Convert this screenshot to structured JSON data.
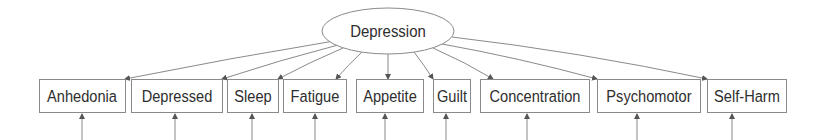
{
  "diagram": {
    "type": "factor-model",
    "latent": {
      "id": "depression",
      "label": "Depression"
    },
    "indicators": [
      {
        "id": "anhedonia",
        "label": "Anhedonia"
      },
      {
        "id": "depressed",
        "label": "Depressed"
      },
      {
        "id": "sleep",
        "label": "Sleep"
      },
      {
        "id": "fatigue",
        "label": "Fatigue"
      },
      {
        "id": "appetite",
        "label": "Appetite"
      },
      {
        "id": "guilt",
        "label": "Guilt"
      },
      {
        "id": "concentration",
        "label": "Concentration"
      },
      {
        "id": "psychomotor",
        "label": "Psychomotor"
      },
      {
        "id": "self-harm",
        "label": "Self-Harm"
      }
    ],
    "edges": [
      {
        "from": "depression",
        "to": "anhedonia",
        "kind": "loading"
      },
      {
        "from": "depression",
        "to": "depressed",
        "kind": "loading"
      },
      {
        "from": "depression",
        "to": "sleep",
        "kind": "loading"
      },
      {
        "from": "depression",
        "to": "fatigue",
        "kind": "loading"
      },
      {
        "from": "depression",
        "to": "appetite",
        "kind": "loading"
      },
      {
        "from": "depression",
        "to": "guilt",
        "kind": "loading"
      },
      {
        "from": "depression",
        "to": "concentration",
        "kind": "loading"
      },
      {
        "from": "depression",
        "to": "psychomotor",
        "kind": "loading"
      },
      {
        "from": "depression",
        "to": "self-harm",
        "kind": "loading"
      }
    ],
    "error_terms": [
      "anhedonia",
      "depressed",
      "sleep",
      "fatigue",
      "appetite",
      "guilt",
      "concentration",
      "psychomotor",
      "self-harm"
    ]
  }
}
